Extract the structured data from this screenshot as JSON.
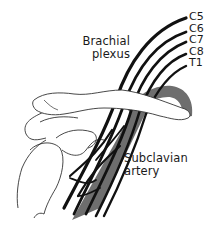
{
  "diagram": {
    "labels": {
      "brachial_plexus_line1": "Brachial",
      "brachial_plexus_line2": "plexus",
      "subclavian_artery_line1": "Subclavian",
      "subclavian_artery_line2": "artery"
    },
    "nerve_roots": [
      "C5",
      "C6",
      "C7",
      "C8",
      "T1"
    ],
    "colors": {
      "nerve": "#111111",
      "artery": "#6e6e6e",
      "outline": "#333333",
      "background": "#ffffff"
    }
  }
}
